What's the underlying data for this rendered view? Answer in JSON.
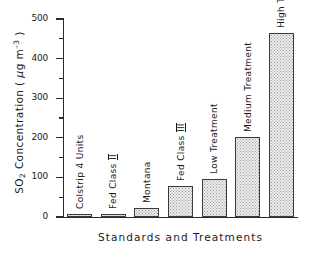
{
  "chart_data": {
    "type": "bar",
    "title": "",
    "xlabel": "Standards and Treatments",
    "ylabel": "SO2 Concentration ( μg m-3 )",
    "ylabel_parts": {
      "prefix": "SO",
      "subscript": "2",
      "mid": " Concentration ( ",
      "mu": "μ",
      "unit": "g m",
      "superscript": "–3",
      "suffix": " )"
    },
    "categories": [
      "Colstrip 4 Units",
      "Fed Class II",
      "Montana",
      "Fed Class III",
      "Low Treatment",
      "Medium Treatment",
      "High Treatment"
    ],
    "values": [
      8,
      8,
      23,
      79,
      95,
      202,
      465
    ],
    "ylim": [
      0,
      500
    ],
    "yticks": [
      0,
      100,
      200,
      300,
      400,
      500
    ],
    "ytick_labels": [
      "0",
      "100",
      "200",
      "300",
      "400",
      "500"
    ],
    "yminor_ticks": [
      50,
      150,
      250,
      350,
      450
    ],
    "grid": false,
    "legend": null,
    "bar_style": {
      "fill": "#ededed",
      "pattern": "dotted-hatch",
      "edge": "#3a3a3a"
    },
    "label_orientation": "vertical",
    "bars": [
      {
        "label": "Colstrip 4 Units",
        "value": 8,
        "label_suffix": ""
      },
      {
        "label": "Fed Class",
        "value": 8,
        "label_suffix": "II"
      },
      {
        "label": "Montana",
        "value": 23,
        "label_suffix": ""
      },
      {
        "label": "Fed Class",
        "value": 79,
        "label_suffix": "III"
      },
      {
        "label": "Low Treatment",
        "value": 95,
        "label_suffix": ""
      },
      {
        "label": "Medium Treatment",
        "value": 202,
        "label_suffix": ""
      },
      {
        "label": "High Treatment",
        "value": 465,
        "label_suffix": ""
      }
    ]
  }
}
